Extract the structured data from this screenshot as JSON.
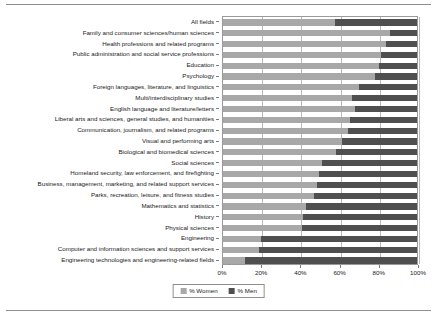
{
  "chart_data": {
    "type": "bar",
    "orientation": "horizontal",
    "stacked": true,
    "stacked_percent": true,
    "title": "",
    "xlabel": "",
    "ylabel": "",
    "xlim": [
      0,
      100
    ],
    "xticks": [
      0,
      20,
      40,
      60,
      80,
      100
    ],
    "xticklabels": [
      "0%",
      "20%",
      "40%",
      "60%",
      "80%",
      "100%"
    ],
    "grid": true,
    "legend_position": "bottom-center",
    "categories": [
      "All fields",
      "Family and consumer sciences/human sciences",
      "Health professions and related programs",
      "Public administration and social service professions",
      "Education",
      "Psychology",
      "Foreign languages, literature, and linguistics",
      "Multi/interdisciplinary studies",
      "English language and literature/letters",
      "Liberal arts and sciences, general studies, and humanities",
      "Communication, journalism, and related programs",
      "Visual and performing arts",
      "Biological and biomedical sciences",
      "Social sciences",
      "Homeland security, law enforcement, and firefighting",
      "Business, management, marketing, and related support services",
      "Parks, recreation, leisure, and fitness studies",
      "Mathematics and statistics",
      "History",
      "Physical sciences",
      "Engineering",
      "Computer and information sciences and support services",
      "Engineering technologies and engineering-related fields"
    ],
    "series": [
      {
        "name": "% Women",
        "color": "#a8a8a8",
        "values": [
          57.7,
          86.0,
          84.0,
          81.5,
          80.5,
          78.5,
          70.0,
          66.5,
          68.0,
          65.5,
          64.5,
          61.5,
          58.5,
          51.0,
          49.5,
          48.5,
          47.0,
          43.0,
          41.0,
          40.5,
          19.5,
          18.5,
          11.5
        ]
      },
      {
        "name": "% Men",
        "color": "#4f4f4f",
        "values": [
          42.3,
          14.0,
          16.0,
          18.5,
          19.5,
          21.5,
          30.0,
          33.5,
          32.0,
          34.5,
          35.5,
          38.5,
          41.5,
          49.0,
          50.5,
          51.5,
          53.0,
          57.0,
          59.0,
          59.5,
          80.5,
          81.5,
          88.5
        ]
      }
    ]
  },
  "legend": {
    "items": [
      {
        "label": "% Women",
        "swatch": "women"
      },
      {
        "label": "% Men",
        "swatch": "men"
      }
    ]
  }
}
